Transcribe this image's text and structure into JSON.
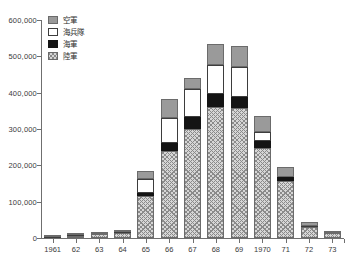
{
  "chart_data": {
    "type": "bar",
    "stacked": true,
    "title": "",
    "xlabel": "",
    "ylabel": "",
    "ylim": [
      0,
      600000
    ],
    "ytick_values": [
      0,
      100000,
      200000,
      300000,
      400000,
      500000,
      600000
    ],
    "ytick_labels": [
      "0",
      "100,000",
      "200,000",
      "300,000",
      "400,000",
      "500,000",
      "600,000"
    ],
    "grid": false,
    "legend_position": "top-left",
    "categories": [
      "1961",
      "62",
      "63",
      "64",
      "65",
      "66",
      "67",
      "68",
      "69",
      "1970",
      "71",
      "72",
      "73"
    ],
    "series": [
      {
        "name": "陸軍",
        "key": "army",
        "color": "#d6d6d6",
        "pattern": "hatch",
        "values": [
          1000,
          6000,
          10000,
          14000,
          116000,
          239000,
          301000,
          360000,
          359000,
          249000,
          158000,
          30000,
          13000
        ]
      },
      {
        "name": "海軍",
        "key": "navy",
        "color": "#141414",
        "pattern": "solid",
        "values": [
          300,
          700,
          800,
          1100,
          8400,
          23300,
          31000,
          36000,
          30000,
          17000,
          9000,
          1500,
          500
        ]
      },
      {
        "name": "海兵隊",
        "key": "marines",
        "color": "#ffffff",
        "pattern": "solid",
        "values": [
          200,
          500,
          600,
          900,
          38000,
          69000,
          78000,
          81000,
          81000,
          25000,
          500,
          200,
          100
        ]
      },
      {
        "name": "空軍",
        "key": "air",
        "color": "#9a9a9a",
        "pattern": "solid",
        "values": [
          500,
          1000,
          1500,
          2000,
          21000,
          52600,
          31000,
          58000,
          58000,
          44000,
          29000,
          12000,
          1400
        ]
      }
    ],
    "totals": [
      2000,
      8200,
      12900,
      18000,
      183400,
      383900,
      441000,
      535000,
      528000,
      335000,
      196500,
      43700,
      15000
    ]
  }
}
